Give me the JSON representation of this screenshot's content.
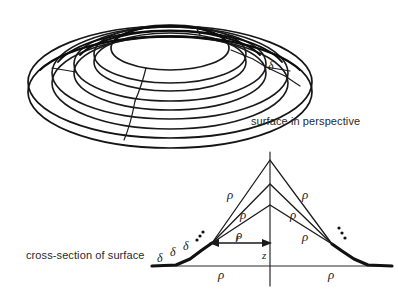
{
  "figure": {
    "title_top": "surface in perspective",
    "title_bottom": "cross-section of surface",
    "symbols": {
      "rho": "ρ",
      "delta": "δ",
      "r": "r",
      "z": "z",
      "ellipsis": "⋯"
    }
  },
  "top_diagram": {
    "name": "surface-in-perspective",
    "caption": "surface in perspective",
    "description": "terraced dome drawn as concentric ellipses",
    "ring_count": 5,
    "step_label": "δ",
    "step_label_position": {
      "x": 268,
      "y": 67
    }
  },
  "bottom_diagram": {
    "name": "cross-section-of-surface",
    "caption": "cross-section of surface",
    "vertical_axis_label": "z",
    "radius_arrow_label": "r",
    "slope_labels_left": [
      "ρ",
      "ρ",
      "ρ"
    ],
    "slope_labels_right": [
      "ρ",
      "ρ",
      "ρ"
    ],
    "baseline_labels": [
      "ρ",
      "ρ"
    ],
    "step_labels_left": [
      "δ",
      "δ",
      "δ"
    ],
    "ellipsis_left": "⋯",
    "ellipsis_right": "⋯"
  },
  "labels": {
    "top_delta": "δ",
    "left_rho_1": "ρ",
    "left_rho_2": "ρ",
    "left_rho_3": "ρ",
    "right_rho_1": "ρ",
    "right_rho_2": "ρ",
    "right_rho_3": "ρ",
    "base_rho_left": "ρ",
    "base_rho_right": "ρ",
    "delta_a": "δ",
    "delta_b": "δ",
    "delta_c": "δ",
    "r_label": "r",
    "z_label": "z"
  },
  "colors": {
    "ink": "#1a1a1a",
    "caption": "#2a2a2a",
    "background": "#ffffff",
    "thick_stroke": "#111111",
    "thin_stroke": "#2b2b2b"
  }
}
